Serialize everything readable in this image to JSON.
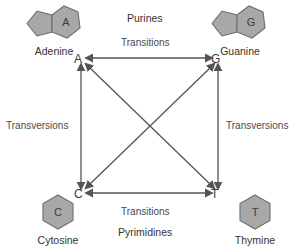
{
  "diagram": {
    "colors": {
      "arrow": "#555555",
      "text": "#3a3a3a",
      "molecule_fill": "#a8a8a8",
      "molecule_stroke": "#6e6e6e",
      "background": "#ffffff"
    },
    "nodes": [
      {
        "id": "A",
        "letter": "A",
        "x": 80,
        "y": 62,
        "corner": "top-left"
      },
      {
        "id": "G",
        "letter": "G",
        "x": 216,
        "y": 62,
        "corner": "top-right"
      },
      {
        "id": "C",
        "letter": "C",
        "x": 80,
        "y": 196,
        "corner": "bottom-left"
      },
      {
        "id": "T",
        "letter": "T",
        "x": 216,
        "y": 196,
        "corner": "bottom-right"
      }
    ],
    "edges": [
      {
        "id": "a-g",
        "from": "A",
        "to": "G",
        "type": "transition",
        "bidirectional": true
      },
      {
        "id": "c-t",
        "from": "C",
        "to": "T",
        "type": "transition",
        "bidirectional": true
      },
      {
        "id": "a-c",
        "from": "A",
        "to": "C",
        "type": "transversion",
        "bidirectional": true
      },
      {
        "id": "g-t",
        "from": "G",
        "to": "T",
        "type": "transversion",
        "bidirectional": true
      },
      {
        "id": "a-t",
        "from": "A",
        "to": "T",
        "type": "transversion",
        "bidirectional": true
      },
      {
        "id": "c-g",
        "from": "C",
        "to": "G",
        "type": "transversion",
        "bidirectional": true
      }
    ],
    "edge_labels": {
      "top_transitions": "Transitions",
      "bottom_transitions": "Transitions",
      "left_transversions": "Transversions",
      "right_transversions": "Transversions"
    },
    "group_labels": {
      "purines": "Purines",
      "pyrimidines": "Pyrimidines"
    },
    "bases": [
      {
        "id": "adenine",
        "symbol": "A",
        "name": "Adenine",
        "class": "purine",
        "shape": "bicyclic-purine"
      },
      {
        "id": "guanine",
        "symbol": "G",
        "name": "Guanine",
        "class": "purine",
        "shape": "bicyclic-purine"
      },
      {
        "id": "cytosine",
        "symbol": "C",
        "name": "Cytosine",
        "class": "pyrimidine",
        "shape": "hexagon"
      },
      {
        "id": "thymine",
        "symbol": "T",
        "name": "Thymine",
        "class": "pyrimidine",
        "shape": "hexagon"
      }
    ]
  }
}
